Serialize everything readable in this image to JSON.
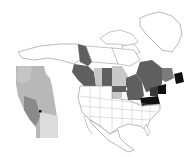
{
  "map": {
    "type": "choropleth",
    "region": "North America",
    "colors": {
      "background": "#ffffff",
      "outline": "#9a9a9a",
      "dark": "#5f5f5f",
      "light": "#c8c8c8",
      "black": "#111111",
      "inset_base": "#b8b8b8",
      "inset_light": "#dcdcdc",
      "inset_dark": "#8a8a8a"
    },
    "inset": {
      "region": "Alberta",
      "marker": "point-marker"
    },
    "legend": null
  }
}
